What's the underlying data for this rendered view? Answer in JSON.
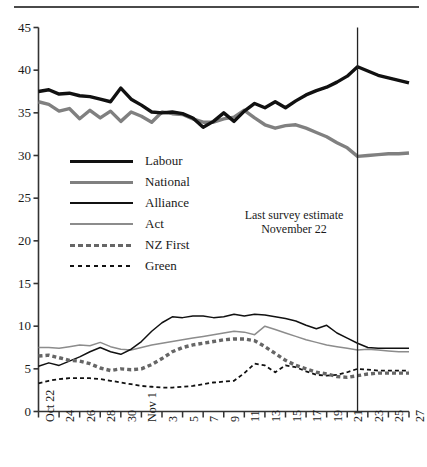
{
  "chart_data": {
    "type": "line",
    "title": "",
    "subtitle": "",
    "xlabel": "",
    "ylabel": "",
    "ylim": [
      0,
      45
    ],
    "ytick_step": 5,
    "yticks": [
      "0",
      "5",
      "10",
      "15",
      "20",
      "25",
      "30",
      "35",
      "40",
      "45"
    ],
    "grid": false,
    "legend_position": "inside-left",
    "x": [
      "Oct 22",
      "Oct 23",
      "Oct 24",
      "Oct 25",
      "Oct 26",
      "Oct 27",
      "Oct 28",
      "Oct 29",
      "Oct 30",
      "Oct 31",
      "Nov 1",
      "Nov 2",
      "Nov 3",
      "Nov 4",
      "Nov 5",
      "Nov 6",
      "Nov 7",
      "Nov 8",
      "Nov 9",
      "Nov 10",
      "Nov 11",
      "Nov 12",
      "Nov 13",
      "Nov 14",
      "Nov 15",
      "Nov 16",
      "Nov 17",
      "Nov 18",
      "Nov 19",
      "Nov 20",
      "Nov 21",
      "Nov 22",
      "Nov 23",
      "Nov 24",
      "Nov 25",
      "Nov 26",
      "Nov 27"
    ],
    "xtick_labels": [
      "Oct 22",
      "24",
      "26",
      "28",
      "30",
      "Nov 1",
      "3",
      "5",
      "7",
      "9",
      "11",
      "13",
      "15",
      "17",
      "19",
      "21",
      "23",
      "25",
      "27"
    ],
    "xtick_indices": [
      0,
      2,
      4,
      6,
      8,
      10,
      12,
      14,
      16,
      18,
      20,
      22,
      24,
      26,
      28,
      30,
      32,
      34,
      36
    ],
    "annotation": {
      "line1": "Last survey estimate",
      "line2": "November 22",
      "vline_x_index": 31
    },
    "series": [
      {
        "name": "Labour",
        "color": "#111111",
        "width": 3.4,
        "dash": "none",
        "values": [
          37.5,
          37.7,
          37.2,
          37.3,
          37.0,
          36.9,
          36.6,
          36.3,
          37.9,
          36.6,
          35.9,
          35.1,
          35.0,
          35.1,
          34.9,
          34.4,
          33.3,
          34.0,
          35.0,
          34.0,
          35.2,
          36.1,
          35.6,
          36.3,
          35.6,
          36.4,
          37.1,
          37.6,
          38.0,
          38.6,
          39.3,
          40.4,
          39.9,
          39.4,
          39.1,
          38.8,
          38.5
        ]
      },
      {
        "name": "National",
        "color": "#808080",
        "width": 3.4,
        "dash": "none",
        "values": [
          36.3,
          36.0,
          35.2,
          35.5,
          34.3,
          35.3,
          34.4,
          35.2,
          34.0,
          35.1,
          34.6,
          33.9,
          35.1,
          34.9,
          34.8,
          34.3,
          33.9,
          33.9,
          34.3,
          34.5,
          35.3,
          34.4,
          33.6,
          33.2,
          33.5,
          33.6,
          33.2,
          32.7,
          32.2,
          31.5,
          30.9,
          29.9,
          30.0,
          30.1,
          30.2,
          30.2,
          30.3
        ]
      },
      {
        "name": "Alliance",
        "color": "#111111",
        "width": 1.5,
        "dash": "none",
        "values": [
          5.3,
          5.7,
          5.4,
          5.9,
          6.4,
          7.0,
          7.5,
          7.0,
          6.7,
          7.3,
          8.2,
          9.4,
          10.4,
          11.1,
          11.0,
          11.2,
          11.2,
          11.0,
          11.1,
          11.4,
          11.2,
          11.4,
          11.3,
          11.1,
          10.9,
          10.6,
          10.1,
          9.7,
          10.1,
          9.2,
          8.6,
          8.0,
          7.5,
          7.4,
          7.4,
          7.4,
          7.4
        ]
      },
      {
        "name": "Act",
        "color": "#8c8c8c",
        "width": 1.5,
        "dash": "none",
        "values": [
          7.5,
          7.5,
          7.4,
          7.6,
          7.8,
          7.7,
          8.1,
          7.6,
          7.3,
          7.2,
          7.5,
          7.8,
          8.0,
          8.2,
          8.4,
          8.6,
          8.8,
          9.0,
          9.2,
          9.4,
          9.3,
          9.0,
          10.0,
          9.6,
          9.2,
          8.8,
          8.4,
          8.1,
          7.8,
          7.6,
          7.4,
          7.2,
          7.3,
          7.2,
          7.1,
          7.0,
          7.0
        ]
      },
      {
        "name": "NZ First",
        "color": "#666666",
        "width": 3.4,
        "dash": "4,3",
        "values": [
          6.5,
          6.6,
          6.3,
          6.0,
          5.9,
          5.6,
          5.1,
          4.8,
          5.0,
          4.9,
          5.0,
          5.5,
          6.2,
          7.0,
          7.5,
          7.8,
          8.0,
          8.2,
          8.4,
          8.5,
          8.5,
          8.3,
          7.6,
          6.8,
          6.0,
          5.4,
          5.0,
          4.6,
          4.4,
          4.1,
          4.0,
          4.2,
          4.4,
          4.5,
          4.5,
          4.5,
          4.5
        ]
      },
      {
        "name": "Green",
        "color": "#111111",
        "width": 1.8,
        "dash": "4,3",
        "values": [
          3.3,
          3.6,
          3.8,
          3.9,
          3.9,
          3.9,
          3.8,
          3.6,
          3.4,
          3.2,
          3.0,
          2.9,
          2.8,
          2.8,
          2.9,
          3.0,
          3.2,
          3.4,
          3.5,
          3.6,
          4.5,
          5.6,
          5.4,
          4.6,
          5.4,
          5.2,
          4.7,
          4.3,
          4.2,
          4.3,
          4.6,
          5.0,
          4.9,
          4.8,
          4.8,
          4.8,
          4.8
        ]
      }
    ]
  },
  "legend": {
    "items": [
      {
        "label": "Labour"
      },
      {
        "label": "National"
      },
      {
        "label": "Alliance"
      },
      {
        "label": "Act"
      },
      {
        "label": "NZ First"
      },
      {
        "label": "Green"
      }
    ]
  }
}
